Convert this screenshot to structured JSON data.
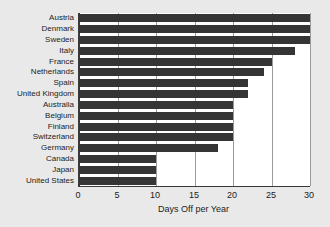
{
  "chart_data": {
    "type": "bar",
    "orientation": "horizontal",
    "title": "",
    "xlabel": "Days Off per Year",
    "ylabel": "",
    "xlim": [
      0,
      30
    ],
    "xticks": [
      0,
      5,
      10,
      15,
      20,
      25,
      30
    ],
    "grid": true,
    "legend": false,
    "bar_color": "#353535",
    "plot_background": "#ffffff",
    "page_background": "#e9e9e9",
    "categories": [
      "Austria",
      "Denmark",
      "Sweden",
      "Italy",
      "France",
      "Netherlands",
      "Spain",
      "United Kingdom",
      "Australia",
      "Belgium",
      "Finland",
      "Switzerland",
      "Germany",
      "Canada",
      "Japan",
      "United States"
    ],
    "values": [
      30,
      30,
      30,
      28,
      25,
      24,
      22,
      22,
      20,
      20,
      20,
      20,
      18,
      10,
      10,
      10
    ]
  }
}
